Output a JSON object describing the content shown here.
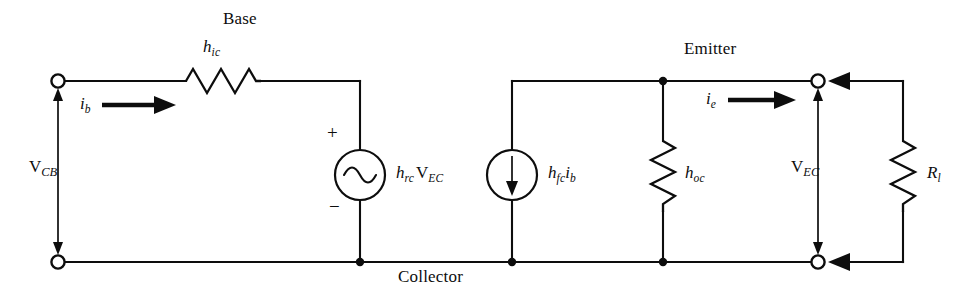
{
  "figure": {
    "background_color": "#ffffff",
    "ink_color": "#0d0d0d"
  },
  "nodes": {
    "base_label": "Base",
    "emitter_label": "Emitter",
    "collector_label": "Collector"
  },
  "components": {
    "input_resistor": {
      "label_main": "h",
      "label_sub": "ic",
      "type": "resistor-horizontal"
    },
    "voltage_source": {
      "label_gain_main": "h",
      "label_gain_sub": "rc",
      "label_v_main": "V",
      "label_v_sub": "EC",
      "plus_sign": "+",
      "minus_sign": "−",
      "type": "ac-voltage-source"
    },
    "current_source": {
      "label_gain_main": "h",
      "label_gain_sub": "fc",
      "label_i_main": "i",
      "label_i_sub": "b",
      "type": "current-source",
      "arrow_direction": "down"
    },
    "output_conductance": {
      "label_main": "h",
      "label_sub": "oc",
      "type": "resistor-vertical"
    },
    "load_resistor": {
      "label_main": "R",
      "label_sub": "l",
      "type": "resistor-vertical"
    }
  },
  "signals": {
    "input_current": {
      "label_main": "i",
      "label_sub": "b",
      "direction": "right"
    },
    "output_current": {
      "label_main": "i",
      "label_sub": "e",
      "direction": "right"
    },
    "input_voltage": {
      "label_main": "V",
      "label_sub": "CB",
      "arrow_style": "double-headed-vertical"
    },
    "output_voltage": {
      "label_main": "V",
      "label_sub": "EC",
      "arrow_style": "double-headed-vertical"
    }
  },
  "terminals": [
    {
      "name": "base-terminal",
      "position": "top-left"
    },
    {
      "name": "collector-terminal-left",
      "position": "bottom-left"
    },
    {
      "name": "emitter-terminal",
      "position": "top-right"
    },
    {
      "name": "collector-terminal-right",
      "position": "bottom-right"
    }
  ]
}
